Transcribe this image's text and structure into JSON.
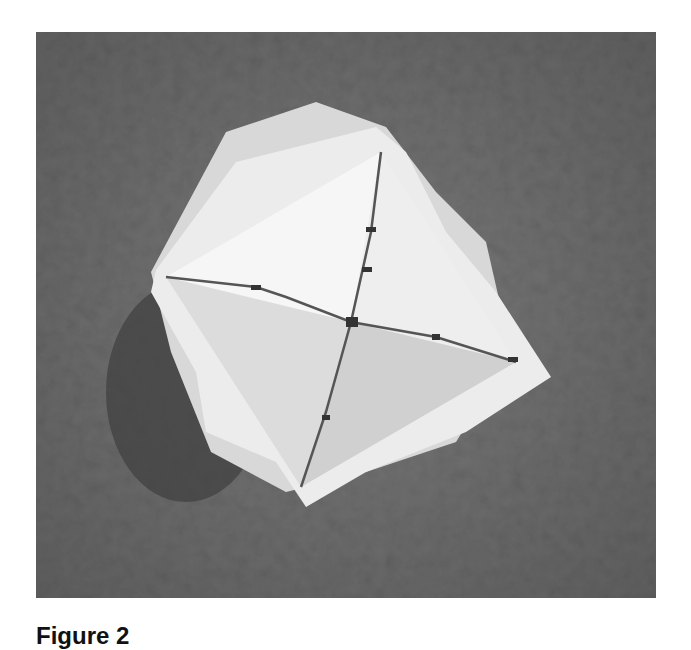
{
  "figure": {
    "caption": "Figure 2",
    "colors": {
      "background": "#6e6e6e",
      "shadow": "#3e3e3e",
      "paper_light": "#f2f2f2",
      "paper_mid": "#d9d9d9",
      "edge_line": "#555555"
    }
  }
}
